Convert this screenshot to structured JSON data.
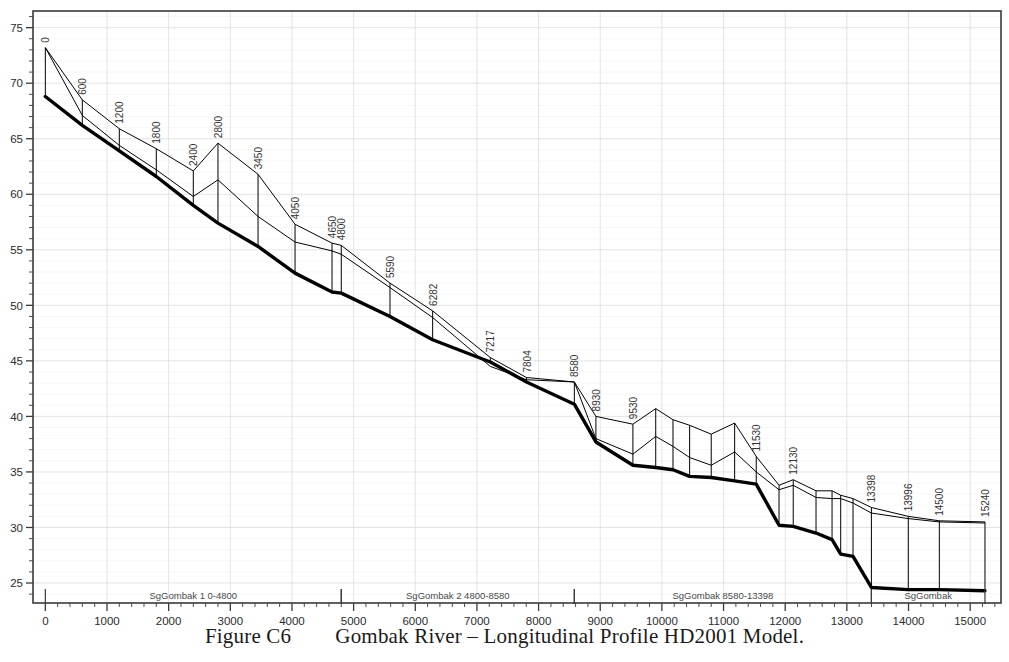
{
  "figure": {
    "caption_number": "Figure C6",
    "caption_text": "Gombak River – Longitudinal Profile HD2001 Model."
  },
  "chart_data": {
    "type": "line",
    "title": "Gombak River – Longitudinal Profile HD2001 Model.",
    "xlabel": "",
    "ylabel": "",
    "xlim": [
      -200,
      15500
    ],
    "ylim": [
      23.2,
      76.5
    ],
    "xticks": [
      0,
      1000,
      2000,
      3000,
      4000,
      5000,
      6000,
      7000,
      8000,
      9000,
      10000,
      11000,
      12000,
      13000,
      14000,
      15000
    ],
    "xtick_labels": [
      "0",
      "1000",
      "2000",
      "3000",
      "4000",
      "5000",
      "6000",
      "7000",
      "8000",
      "9000",
      "10000",
      "11000",
      "12000",
      "13000",
      "14000",
      "15000"
    ],
    "yticks": [
      25,
      30,
      35,
      40,
      45,
      50,
      55,
      60,
      65,
      70,
      75
    ],
    "ytick_labels": [
      "25",
      "30",
      "35",
      "40",
      "45",
      "50",
      "55",
      "60",
      "65",
      "70",
      "75"
    ],
    "x_minor_interval": 200,
    "y_minor_interval": 1,
    "grid": true,
    "legend": "none",
    "series": [
      {
        "name": "bed-level",
        "style": "thick",
        "color": "#000000",
        "x": [
          0,
          600,
          1200,
          1800,
          2400,
          2800,
          3450,
          4050,
          4650,
          4800,
          5590,
          6282,
          7217,
          7804,
          8580,
          8930,
          9530,
          9900,
          10180,
          10450,
          10800,
          11180,
          11530,
          11900,
          12130,
          12500,
          12760,
          12900,
          13100,
          13398,
          13996,
          14500,
          15240
        ],
        "y": [
          68.8,
          66.2,
          63.9,
          61.6,
          59.0,
          57.4,
          55.3,
          52.9,
          51.2,
          51.1,
          49.0,
          46.9,
          44.9,
          43.1,
          41.1,
          37.7,
          35.6,
          35.4,
          35.2,
          34.6,
          34.5,
          34.2,
          33.9,
          30.2,
          30.1,
          29.5,
          28.9,
          27.6,
          27.4,
          24.6,
          24.4,
          24.4,
          24.3
        ]
      },
      {
        "name": "bank-top-level",
        "style": "thin",
        "color": "#000000",
        "x": [
          0,
          600,
          1200,
          1800,
          2400,
          2800,
          3450,
          4050,
          4650,
          4800,
          5590,
          6282,
          7217,
          7804,
          8580,
          8930,
          9530,
          9900,
          10180,
          10450,
          10800,
          11180,
          11530,
          11900,
          12130,
          12500,
          12760,
          12900,
          13100,
          13398,
          13996,
          14500,
          15240
        ],
        "y": [
          73.2,
          68.5,
          65.9,
          64.1,
          62.1,
          64.6,
          61.8,
          57.3,
          55.6,
          55.4,
          52.0,
          49.5,
          45.3,
          43.5,
          43.1,
          40.0,
          39.3,
          40.7,
          39.7,
          39.2,
          38.4,
          39.4,
          36.4,
          33.8,
          34.3,
          33.3,
          33.3,
          32.9,
          32.6,
          31.8,
          31.0,
          30.6,
          30.5
        ]
      },
      {
        "name": "bank-top-secondary",
        "style": "thin",
        "color": "#000000",
        "x": [
          0,
          600,
          1200,
          1800,
          2400,
          2800,
          3450,
          4050,
          4650,
          4800,
          5590,
          6282,
          7217,
          7804,
          8580,
          8930,
          9530,
          9900,
          10180,
          10450,
          10800,
          11180,
          11530,
          11900,
          12130,
          12500,
          12760,
          12900,
          13100,
          13398,
          13996,
          14500,
          15240
        ],
        "y": [
          73.2,
          67.1,
          64.4,
          62.2,
          59.8,
          61.3,
          58.0,
          55.7,
          54.9,
          54.6,
          51.6,
          48.9,
          44.5,
          43.3,
          43.1,
          38.0,
          36.6,
          38.2,
          37.3,
          36.3,
          35.6,
          36.8,
          35.0,
          33.4,
          33.8,
          32.7,
          32.6,
          32.6,
          32.2,
          31.3,
          30.8,
          30.5,
          30.4
        ]
      }
    ],
    "cross_sections": [
      {
        "label": "0",
        "x": 0,
        "bed": 68.8,
        "top": 73.2
      },
      {
        "label": "600",
        "x": 600,
        "bed": 66.2,
        "top": 68.5
      },
      {
        "label": "1200",
        "x": 1200,
        "bed": 63.9,
        "top": 65.9
      },
      {
        "label": "1800",
        "x": 1800,
        "bed": 61.6,
        "top": 64.1
      },
      {
        "label": "2400",
        "x": 2400,
        "bed": 59.0,
        "top": 62.1
      },
      {
        "label": "2800",
        "x": 2800,
        "bed": 57.4,
        "top": 64.6
      },
      {
        "label": "3450",
        "x": 3450,
        "bed": 55.3,
        "top": 61.8
      },
      {
        "label": "4050",
        "x": 4050,
        "bed": 52.9,
        "top": 57.3
      },
      {
        "label": "4650",
        "x": 4650,
        "bed": 51.2,
        "top": 55.6
      },
      {
        "label": "4800",
        "x": 4800,
        "bed": 51.1,
        "top": 55.4
      },
      {
        "label": "5590",
        "x": 5590,
        "bed": 49.0,
        "top": 52.0
      },
      {
        "label": "6282",
        "x": 6282,
        "bed": 46.9,
        "top": 49.5
      },
      {
        "label": "7217",
        "x": 7217,
        "bed": 44.9,
        "top": 45.3
      },
      {
        "label": "7804",
        "x": 7804,
        "bed": 43.1,
        "top": 43.5
      },
      {
        "label": "8580",
        "x": 8580,
        "bed": 41.1,
        "top": 43.1
      },
      {
        "label": "8930",
        "x": 8930,
        "bed": 37.7,
        "top": 40.0
      },
      {
        "label": "9530",
        "x": 9530,
        "bed": 35.6,
        "top": 39.3
      },
      {
        "label": "",
        "x": 9900,
        "bed": 35.4,
        "top": 40.7
      },
      {
        "label": "",
        "x": 10180,
        "bed": 35.2,
        "top": 39.7
      },
      {
        "label": "",
        "x": 10450,
        "bed": 34.6,
        "top": 39.2
      },
      {
        "label": "",
        "x": 10800,
        "bed": 34.5,
        "top": 38.4
      },
      {
        "label": "",
        "x": 11180,
        "bed": 34.2,
        "top": 39.4
      },
      {
        "label": "11530",
        "x": 11530,
        "bed": 33.9,
        "top": 36.4
      },
      {
        "label": "",
        "x": 11900,
        "bed": 30.2,
        "top": 33.8
      },
      {
        "label": "12130",
        "x": 12130,
        "bed": 30.1,
        "top": 34.3
      },
      {
        "label": "",
        "x": 12500,
        "bed": 29.5,
        "top": 33.3
      },
      {
        "label": "",
        "x": 12760,
        "bed": 28.9,
        "top": 33.3
      },
      {
        "label": "",
        "x": 12900,
        "bed": 27.6,
        "top": 32.9
      },
      {
        "label": "",
        "x": 13100,
        "bed": 27.4,
        "top": 32.6
      },
      {
        "label": "13398",
        "x": 13398,
        "bed": 24.6,
        "top": 31.8
      },
      {
        "label": "13996",
        "x": 13996,
        "bed": 24.4,
        "top": 31.0
      },
      {
        "label": "14500",
        "x": 14500,
        "bed": 24.4,
        "top": 30.6
      },
      {
        "label": "15240",
        "x": 15240,
        "bed": 24.3,
        "top": 30.5
      }
    ],
    "reaches": [
      {
        "label": "SgGombak 1 0-4800",
        "start": 0,
        "end": 4800
      },
      {
        "label": "SgGombak 2 4800-8580",
        "start": 4800,
        "end": 8580
      },
      {
        "label": "SgGombak 8580-13398",
        "start": 8580,
        "end": 13398
      },
      {
        "label": "SgGombak",
        "start": 13398,
        "end": 15240
      }
    ]
  },
  "colors": {
    "bed_line": "#000000",
    "bank_line": "#000000",
    "grid": "#d9d9d9",
    "axis": "#3a3a3a",
    "text": "#2b2b2b",
    "background": "#ffffff"
  }
}
